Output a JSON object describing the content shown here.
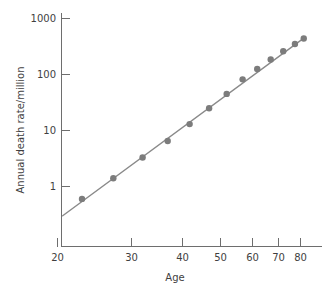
{
  "chart_data": {
    "type": "scatter",
    "title": "",
    "subtitle": "",
    "xlabel": "Age",
    "ylabel": "Annual death rate/million",
    "xscale": "log",
    "yscale": "log",
    "xlim": [
      20,
      84
    ],
    "ylim": [
      0.2,
      1400
    ],
    "grid": false,
    "legend": null,
    "xticks": [
      20,
      30,
      40,
      50,
      60,
      70,
      80
    ],
    "xtick_labels": [
      "20",
      "30",
      "40",
      "50",
      "60",
      "70",
      "80"
    ],
    "yticks": [
      1,
      10,
      100,
      1000
    ],
    "ytick_labels": [
      "1",
      "10",
      "100",
      "1000"
    ],
    "x": [
      23,
      27.5,
      32.5,
      37.5,
      42.5,
      47.5,
      52.5,
      57.5,
      62.5,
      67.5,
      72.5,
      77.5,
      81.5
    ],
    "y": [
      0.6,
      1.4,
      3.3,
      6.5,
      13,
      25,
      45,
      82,
      125,
      185,
      260,
      350,
      440
    ],
    "series": [
      {
        "name": "Annual death rate",
        "marker": "circle",
        "color": "#7c7c7c",
        "points": [
          {
            "age": 23,
            "rate": 0.6
          },
          {
            "age": 27.5,
            "rate": 1.4
          },
          {
            "age": 32.5,
            "rate": 3.3
          },
          {
            "age": 37.5,
            "rate": 6.5
          },
          {
            "age": 42.5,
            "rate": 13
          },
          {
            "age": 47.5,
            "rate": 25
          },
          {
            "age": 52.5,
            "rate": 45
          },
          {
            "age": 57.5,
            "rate": 82
          },
          {
            "age": 62.5,
            "rate": 125
          },
          {
            "age": 67.5,
            "rate": 185
          },
          {
            "age": 72.5,
            "rate": 260
          },
          {
            "age": 77.5,
            "rate": 350
          },
          {
            "age": 81.5,
            "rate": 440
          }
        ]
      },
      {
        "name": "Fitted line",
        "marker": "none",
        "color": "#8a8a8a",
        "endpoints": [
          {
            "age": 20.6,
            "rate": 0.3
          },
          {
            "age": 82.0,
            "rate": 460
          }
        ]
      }
    ],
    "annotations": []
  },
  "colors": {
    "marker": "#7c7c7c",
    "line": "#8a8a8a",
    "axis": "#6e6e6e",
    "text": "#3f3f3f",
    "background": "#ffffff"
  }
}
